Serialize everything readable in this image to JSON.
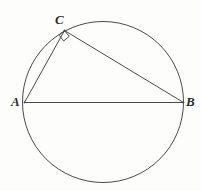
{
  "figure": {
    "type": "geometry-diagram",
    "width": 201,
    "height": 191,
    "background_color": "#fdfdfc",
    "stroke_color": "#4a4a4a",
    "label_color": "#2b2b2b"
  },
  "circle": {
    "name": "main-circle",
    "center_x": 103,
    "center_y": 102,
    "radius": 80.5,
    "stroke_width": 1
  },
  "points": {
    "A": {
      "label": "A",
      "x": 24.5,
      "y": 102.5
    },
    "B": {
      "label": "B",
      "x": 183.5,
      "y": 102.5
    },
    "C": {
      "label": "C",
      "x": 64.5,
      "y": 30.5
    }
  },
  "segments": [
    {
      "name": "segment-AB",
      "from": "A",
      "to": "B",
      "x1": 24.5,
      "y1": 102.5,
      "x2": 183.5,
      "y2": 102.5
    },
    {
      "name": "segment-AC",
      "from": "A",
      "to": "C",
      "x1": 24.5,
      "y1": 102.5,
      "x2": 64.5,
      "y2": 30.5
    },
    {
      "name": "segment-CB",
      "from": "C",
      "to": "B",
      "x1": 64.5,
      "y1": 30.5,
      "x2": 183.5,
      "y2": 102.5
    }
  ],
  "right_angle_marker": {
    "name": "right-angle-marker-at-C",
    "at_point": "C",
    "size": 8,
    "path": "M 64.5 30.5 L 69.2 36.4 L 63.6 41.0 L 59.0 35.1 Z"
  },
  "labels": {
    "A": "A",
    "B": "B",
    "C": "C"
  }
}
